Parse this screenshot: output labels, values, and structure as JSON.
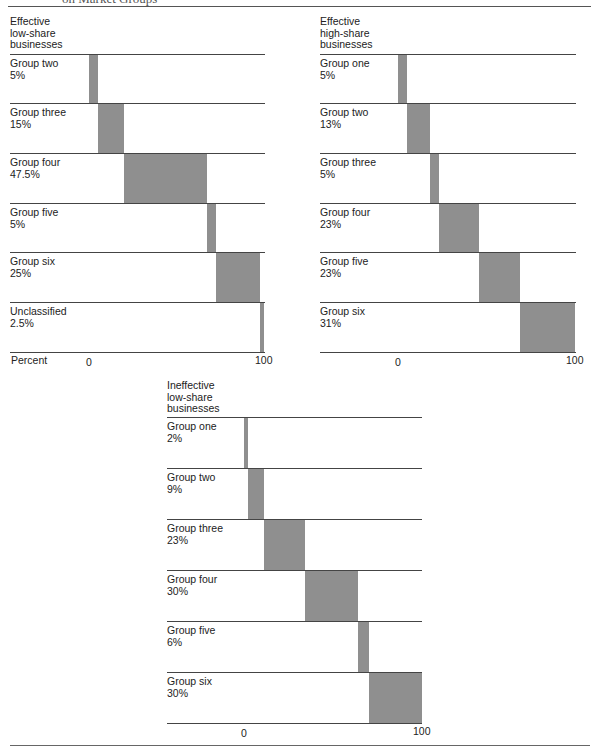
{
  "page": {
    "title": "on Market Groups"
  },
  "chart_data": [
    {
      "type": "bar",
      "subtype": "waterfall-horizontal",
      "title": "Effective low-share businesses",
      "xlabel": "Percent",
      "xlim": [
        0,
        100
      ],
      "ticks": [
        "0",
        "100"
      ],
      "categories": [
        "Group two",
        "Group three",
        "Group four",
        "Group five",
        "Group six",
        "Unclassified"
      ],
      "value_labels": [
        "5%",
        "15%",
        "47.5%",
        "5%",
        "25%",
        "2.5%"
      ],
      "values": [
        5,
        15,
        47.5,
        5,
        25,
        2.5
      ]
    },
    {
      "type": "bar",
      "subtype": "waterfall-horizontal",
      "title": "Effective high-share businesses",
      "xlim": [
        0,
        100
      ],
      "ticks": [
        "0",
        "100"
      ],
      "categories": [
        "Group one",
        "Group two",
        "Group three",
        "Group four",
        "Group five",
        "Group six"
      ],
      "value_labels": [
        "5%",
        "13%",
        "5%",
        "23%",
        "23%",
        "31%"
      ],
      "values": [
        5,
        13,
        5,
        23,
        23,
        31
      ]
    },
    {
      "type": "bar",
      "subtype": "waterfall-horizontal",
      "title": "Ineffective low-share businesses",
      "xlim": [
        0,
        100
      ],
      "ticks": [
        "0",
        "100"
      ],
      "categories": [
        "Group one",
        "Group two",
        "Group three",
        "Group four",
        "Group five",
        "Group six"
      ],
      "value_labels": [
        "2%",
        "9%",
        "23%",
        "30%",
        "6%",
        "30%"
      ],
      "values": [
        2,
        9,
        23,
        30,
        6,
        30
      ]
    }
  ],
  "panels": [
    {
      "title_lines": [
        "Effective",
        "low-share",
        "businesses"
      ],
      "axis_name": "Percent",
      "tick_min": "0",
      "tick_max": "100",
      "rows": [
        {
          "name": "Group two",
          "pct": "5%"
        },
        {
          "name": "Group three",
          "pct": "15%"
        },
        {
          "name": "Group four",
          "pct": "47.5%"
        },
        {
          "name": "Group five",
          "pct": "5%"
        },
        {
          "name": "Group six",
          "pct": "25%"
        },
        {
          "name": "Unclassified",
          "pct": "2.5%"
        }
      ]
    },
    {
      "title_lines": [
        "Effective",
        "high-share",
        "businesses"
      ],
      "axis_name": "",
      "tick_min": "0",
      "tick_max": "100",
      "rows": [
        {
          "name": "Group one",
          "pct": "5%"
        },
        {
          "name": "Group two",
          "pct": "13%"
        },
        {
          "name": "Group three",
          "pct": "5%"
        },
        {
          "name": "Group four",
          "pct": "23%"
        },
        {
          "name": "Group five",
          "pct": "23%"
        },
        {
          "name": "Group six",
          "pct": "31%"
        }
      ]
    },
    {
      "title_lines": [
        "Ineffective",
        "low-share",
        "businesses"
      ],
      "axis_name": "",
      "tick_min": "0",
      "tick_max": "100",
      "rows": [
        {
          "name": "Group one",
          "pct": "2%"
        },
        {
          "name": "Group two",
          "pct": "9%"
        },
        {
          "name": "Group three",
          "pct": "23%"
        },
        {
          "name": "Group four",
          "pct": "30%"
        },
        {
          "name": "Group five",
          "pct": "6%"
        },
        {
          "name": "Group six",
          "pct": "30%"
        }
      ]
    }
  ],
  "colors": {
    "bar_fill": "#d8d8d8",
    "bar_dots": "#8a8a8a",
    "rule": "#444444"
  }
}
